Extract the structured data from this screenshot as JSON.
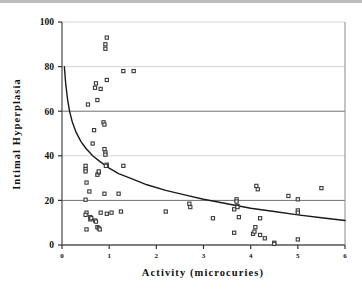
{
  "chart_data": {
    "type": "scatter",
    "title": "",
    "xlabel": "Activity   (microcuries)",
    "ylabel": "Intimal   Hyperplasia",
    "xlim": [
      0,
      6
    ],
    "ylim": [
      0,
      100
    ],
    "xticks": [
      0,
      1,
      2,
      3,
      4,
      5,
      6
    ],
    "xtick_labels": [
      "0",
      "1",
      "2",
      "3",
      "4",
      "5",
      "6"
    ],
    "yticks": [
      0,
      20,
      40,
      60,
      80,
      100
    ],
    "ytick_labels": [
      "0",
      "20",
      "40",
      "60",
      "80",
      "100"
    ],
    "grid": "horizontal",
    "legend": "none",
    "marker": "open-square",
    "marker_color": "#3a3a3a",
    "curve_color": "#1a1a1a",
    "series": [
      {
        "name": "Intimal Hyperplasia vs Activity",
        "points": [
          [
            0.5,
            35.5
          ],
          [
            0.5,
            34.0
          ],
          [
            0.5,
            33.0
          ],
          [
            0.52,
            28.0
          ],
          [
            0.5,
            20.3
          ],
          [
            0.52,
            14.5
          ],
          [
            0.5,
            13.5
          ],
          [
            0.52,
            7.0
          ],
          [
            0.55,
            63.0
          ],
          [
            0.58,
            24.0
          ],
          [
            0.6,
            12.5
          ],
          [
            0.6,
            11.5
          ],
          [
            0.62,
            12.0
          ],
          [
            0.65,
            45.5
          ],
          [
            0.68,
            51.5
          ],
          [
            0.7,
            70.5
          ],
          [
            0.72,
            72.5
          ],
          [
            0.75,
            65.0
          ],
          [
            0.75,
            31.5
          ],
          [
            0.78,
            32.5
          ],
          [
            0.78,
            33.0
          ],
          [
            0.7,
            11.0
          ],
          [
            0.72,
            10.5
          ],
          [
            0.75,
            8.0
          ],
          [
            0.78,
            7.5
          ],
          [
            0.8,
            7.0
          ],
          [
            0.82,
            70.0
          ],
          [
            0.88,
            55.0
          ],
          [
            0.9,
            54.0
          ],
          [
            0.9,
            43.0
          ],
          [
            0.92,
            41.5
          ],
          [
            0.92,
            40.5
          ],
          [
            0.92,
            88.0
          ],
          [
            0.92,
            90.0
          ],
          [
            0.95,
            93.0
          ],
          [
            0.95,
            74.0
          ],
          [
            0.95,
            36.0
          ],
          [
            0.93,
            35.5
          ],
          [
            0.9,
            23.0
          ],
          [
            0.82,
            14.5
          ],
          [
            0.95,
            14.0
          ],
          [
            1.05,
            14.5
          ],
          [
            1.2,
            23.0
          ],
          [
            1.25,
            15.0
          ],
          [
            1.3,
            78.0
          ],
          [
            1.3,
            35.5
          ],
          [
            1.52,
            78.0
          ],
          [
            2.2,
            15.0
          ],
          [
            2.7,
            18.5
          ],
          [
            2.72,
            17.0
          ],
          [
            3.2,
            12.0
          ],
          [
            3.65,
            16.0
          ],
          [
            3.65,
            5.5
          ],
          [
            3.7,
            20.5
          ],
          [
            3.7,
            19.5
          ],
          [
            3.72,
            17.5
          ],
          [
            3.72,
            17.0
          ],
          [
            3.75,
            12.5
          ],
          [
            4.05,
            5.0
          ],
          [
            4.08,
            6.0
          ],
          [
            4.1,
            8.0
          ],
          [
            4.12,
            26.5
          ],
          [
            4.15,
            25.0
          ],
          [
            4.2,
            12.0
          ],
          [
            4.2,
            4.5
          ],
          [
            4.3,
            3.0
          ],
          [
            4.5,
            1.0
          ],
          [
            4.5,
            0.5
          ],
          [
            4.8,
            22.0
          ],
          [
            5.0,
            20.5
          ],
          [
            5.0,
            15.5
          ],
          [
            5.0,
            14.5
          ],
          [
            5.0,
            2.5
          ],
          [
            5.5,
            25.5
          ]
        ]
      }
    ],
    "fit_curve": {
      "name": "power-law fit",
      "description": "decaying power fit from (0.05, 80) to (6, 11)",
      "points": [
        [
          0.05,
          80.0
        ],
        [
          0.08,
          72.0
        ],
        [
          0.12,
          65.0
        ],
        [
          0.16,
          60.0
        ],
        [
          0.22,
          55.0
        ],
        [
          0.3,
          50.5
        ],
        [
          0.4,
          46.5
        ],
        [
          0.5,
          43.5
        ],
        [
          0.65,
          40.0
        ],
        [
          0.8,
          37.5
        ],
        [
          1.0,
          34.5
        ],
        [
          1.2,
          32.0
        ],
        [
          1.5,
          29.5
        ],
        [
          1.8,
          27.0
        ],
        [
          2.2,
          24.5
        ],
        [
          2.6,
          22.5
        ],
        [
          3.0,
          20.5
        ],
        [
          3.5,
          18.5
        ],
        [
          4.0,
          16.5
        ],
        [
          4.5,
          15.0
        ],
        [
          5.0,
          13.5
        ],
        [
          5.5,
          12.2
        ],
        [
          6.0,
          11.0
        ]
      ]
    }
  },
  "figure": {
    "x_axis_title": "Activity   (microcuries)",
    "y_axis_title": "Intimal   Hyperplasia"
  }
}
